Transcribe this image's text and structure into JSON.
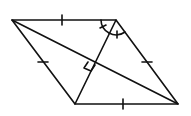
{
  "diagram": {
    "background": "#ffffff",
    "stroke": "#111111",
    "vertices": {
      "A": [
        12,
        20
      ],
      "B": [
        116,
        20
      ],
      "C": [
        178,
        104
      ],
      "D": [
        75,
        104
      ]
    },
    "sides": [
      "AB",
      "BC",
      "CD",
      "DA"
    ],
    "diagonals": [
      "AC",
      "BD"
    ],
    "markings": {
      "equal_side_ticks": 4,
      "right_angle_at_intersection": true,
      "angle_arcs_at_B": 2
    }
  }
}
